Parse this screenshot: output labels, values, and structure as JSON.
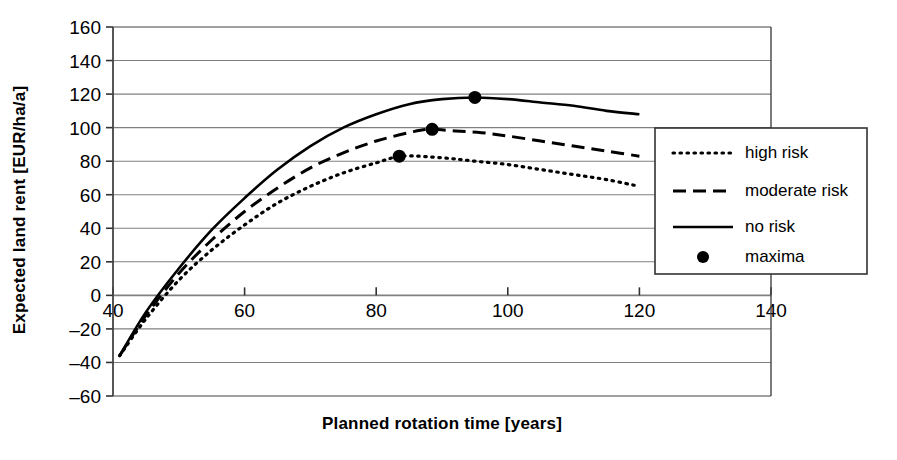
{
  "chart_data": {
    "type": "line",
    "title": "",
    "xlabel": "Planned rotation time [years]",
    "ylabel": "Expected land rent [EUR/ha/a]",
    "xlim": [
      40,
      140
    ],
    "ylim": [
      -60,
      160
    ],
    "xticks": [
      40,
      60,
      80,
      100,
      120,
      140
    ],
    "yticks": [
      -60,
      -40,
      -20,
      0,
      20,
      40,
      60,
      80,
      100,
      120,
      140,
      160
    ],
    "grid": "horizontal",
    "legend_position": "right",
    "series": [
      {
        "name": "high risk",
        "style": "dotted",
        "x": [
          41,
          45,
          50,
          55,
          60,
          65,
          70,
          75,
          80,
          84,
          90,
          95,
          100,
          105,
          110,
          115,
          120
        ],
        "values": [
          -36,
          -14,
          9,
          27,
          42,
          55,
          65,
          73,
          79,
          83,
          82,
          80,
          78,
          75,
          72,
          69,
          65
        ]
      },
      {
        "name": "moderate risk",
        "style": "dashed",
        "x": [
          41,
          45,
          50,
          55,
          60,
          65,
          70,
          75,
          80,
          85,
          88,
          92,
          96,
          100,
          105,
          110,
          115,
          120
        ],
        "values": [
          -36,
          -12,
          13,
          33,
          50,
          64,
          76,
          85,
          92,
          97,
          99,
          98,
          97,
          95,
          92,
          89,
          86,
          83
        ]
      },
      {
        "name": "no risk",
        "style": "solid",
        "x": [
          41,
          45,
          50,
          55,
          60,
          65,
          70,
          75,
          80,
          85,
          90,
          95,
          100,
          105,
          110,
          115,
          120
        ],
        "values": [
          -36,
          -10,
          16,
          39,
          58,
          75,
          89,
          100,
          108,
          114,
          117,
          118,
          117,
          115,
          113,
          110,
          108
        ]
      }
    ],
    "maxima": [
      {
        "series": "high risk",
        "x": 83.5,
        "y": 83
      },
      {
        "series": "moderate risk",
        "x": 88.5,
        "y": 99
      },
      {
        "series": "no risk",
        "x": 95,
        "y": 118
      }
    ]
  },
  "legend": {
    "entries": [
      {
        "label": "high risk",
        "marker": "dotted-line"
      },
      {
        "label": "moderate risk",
        "marker": "dashed-line"
      },
      {
        "label": "no risk",
        "marker": "solid-line"
      },
      {
        "label": "maxima",
        "marker": "filled-circle"
      }
    ]
  },
  "colors": {
    "line": "#000000",
    "grid": "#808080",
    "axis": "#555555",
    "background": "#ffffff"
  }
}
